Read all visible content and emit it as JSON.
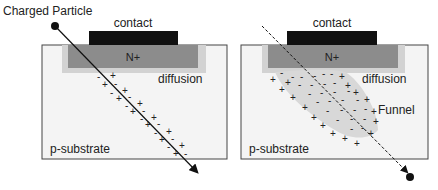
{
  "left_panel": {
    "particle_label": "Charged Particle",
    "contact_label": "contact",
    "nplus_label": "N+",
    "diffusion_label": "diffusion",
    "substrate_label": "p-substrate"
  },
  "right_panel": {
    "contact_label": "contact",
    "nplus_label": "N+",
    "diffusion_label": "diffusion",
    "funnel_label": "Funnel",
    "substrate_label": "p-substrate"
  },
  "colors": {
    "contact": "#111111",
    "nplus": "#8c8c8c",
    "diffusion": "#cfcfcf",
    "substrate": "#f4f4f4",
    "funnel": "#dcdcdc",
    "border": "#444444"
  }
}
